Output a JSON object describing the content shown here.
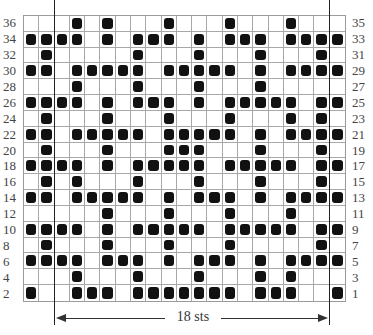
{
  "chart_data": {
    "type": "heatmap",
    "columns": 21,
    "rows": 18,
    "row_labels_left": [
      "36",
      "34",
      "32",
      "30",
      "28",
      "26",
      "24",
      "22",
      "20",
      "18",
      "16",
      "14",
      "12",
      "10",
      "8",
      "6",
      "4",
      "2"
    ],
    "row_labels_right": [
      "35",
      "33",
      "31",
      "29",
      "27",
      "25",
      "23",
      "21",
      "19",
      "17",
      "15",
      "13",
      "11",
      "9",
      "7",
      "5",
      "3",
      "1"
    ],
    "filled_cells_by_row_top_to_bottom": [
      [
        3,
        5,
        9,
        13,
        17
      ],
      [
        0,
        1,
        2,
        3,
        5,
        7,
        8,
        9,
        11,
        13,
        14,
        15,
        17,
        18,
        19,
        20
      ],
      [
        1,
        7,
        11,
        15,
        19
      ],
      [
        0,
        1,
        3,
        4,
        5,
        6,
        7,
        9,
        10,
        11,
        12,
        13,
        15,
        17,
        18,
        19,
        20
      ],
      [
        3,
        7,
        11,
        15
      ],
      [
        0,
        1,
        2,
        3,
        5,
        7,
        8,
        9,
        11,
        13,
        14,
        15,
        16,
        17,
        19,
        20
      ],
      [
        1,
        5,
        9,
        13,
        17,
        19
      ],
      [
        0,
        1,
        3,
        4,
        5,
        6,
        7,
        9,
        10,
        11,
        12,
        13,
        15,
        17,
        18,
        19,
        20
      ],
      [
        1,
        5,
        9,
        10,
        11,
        15,
        19
      ],
      [
        0,
        1,
        2,
        3,
        5,
        7,
        8,
        9,
        10,
        11,
        13,
        14,
        15,
        16,
        17,
        19,
        20
      ],
      [
        1,
        3,
        7,
        11,
        15,
        19
      ],
      [
        0,
        1,
        3,
        4,
        5,
        6,
        7,
        9,
        11,
        12,
        13,
        15,
        17,
        18,
        19,
        20
      ],
      [
        5,
        9,
        13,
        17
      ],
      [
        0,
        1,
        2,
        3,
        5,
        7,
        8,
        9,
        10,
        11,
        13,
        14,
        15,
        16,
        17,
        19,
        20
      ],
      [
        1,
        5,
        9,
        13,
        19
      ],
      [
        0,
        1,
        2,
        3,
        5,
        6,
        7,
        9,
        11,
        12,
        13,
        15,
        17,
        18,
        19,
        20
      ],
      [
        3,
        7,
        11,
        15,
        17
      ],
      [
        0,
        3,
        4,
        5,
        7,
        8,
        9,
        10,
        11,
        12,
        13,
        15,
        16,
        17,
        20
      ]
    ],
    "repeat_marker": {
      "label": "18 sts",
      "left_x": 54,
      "right_x": 329
    },
    "colors": {
      "filled": "#111111",
      "grid": "#a8a8a8",
      "background": "#ffffff"
    }
  },
  "repeat": {
    "label": "18 sts"
  }
}
